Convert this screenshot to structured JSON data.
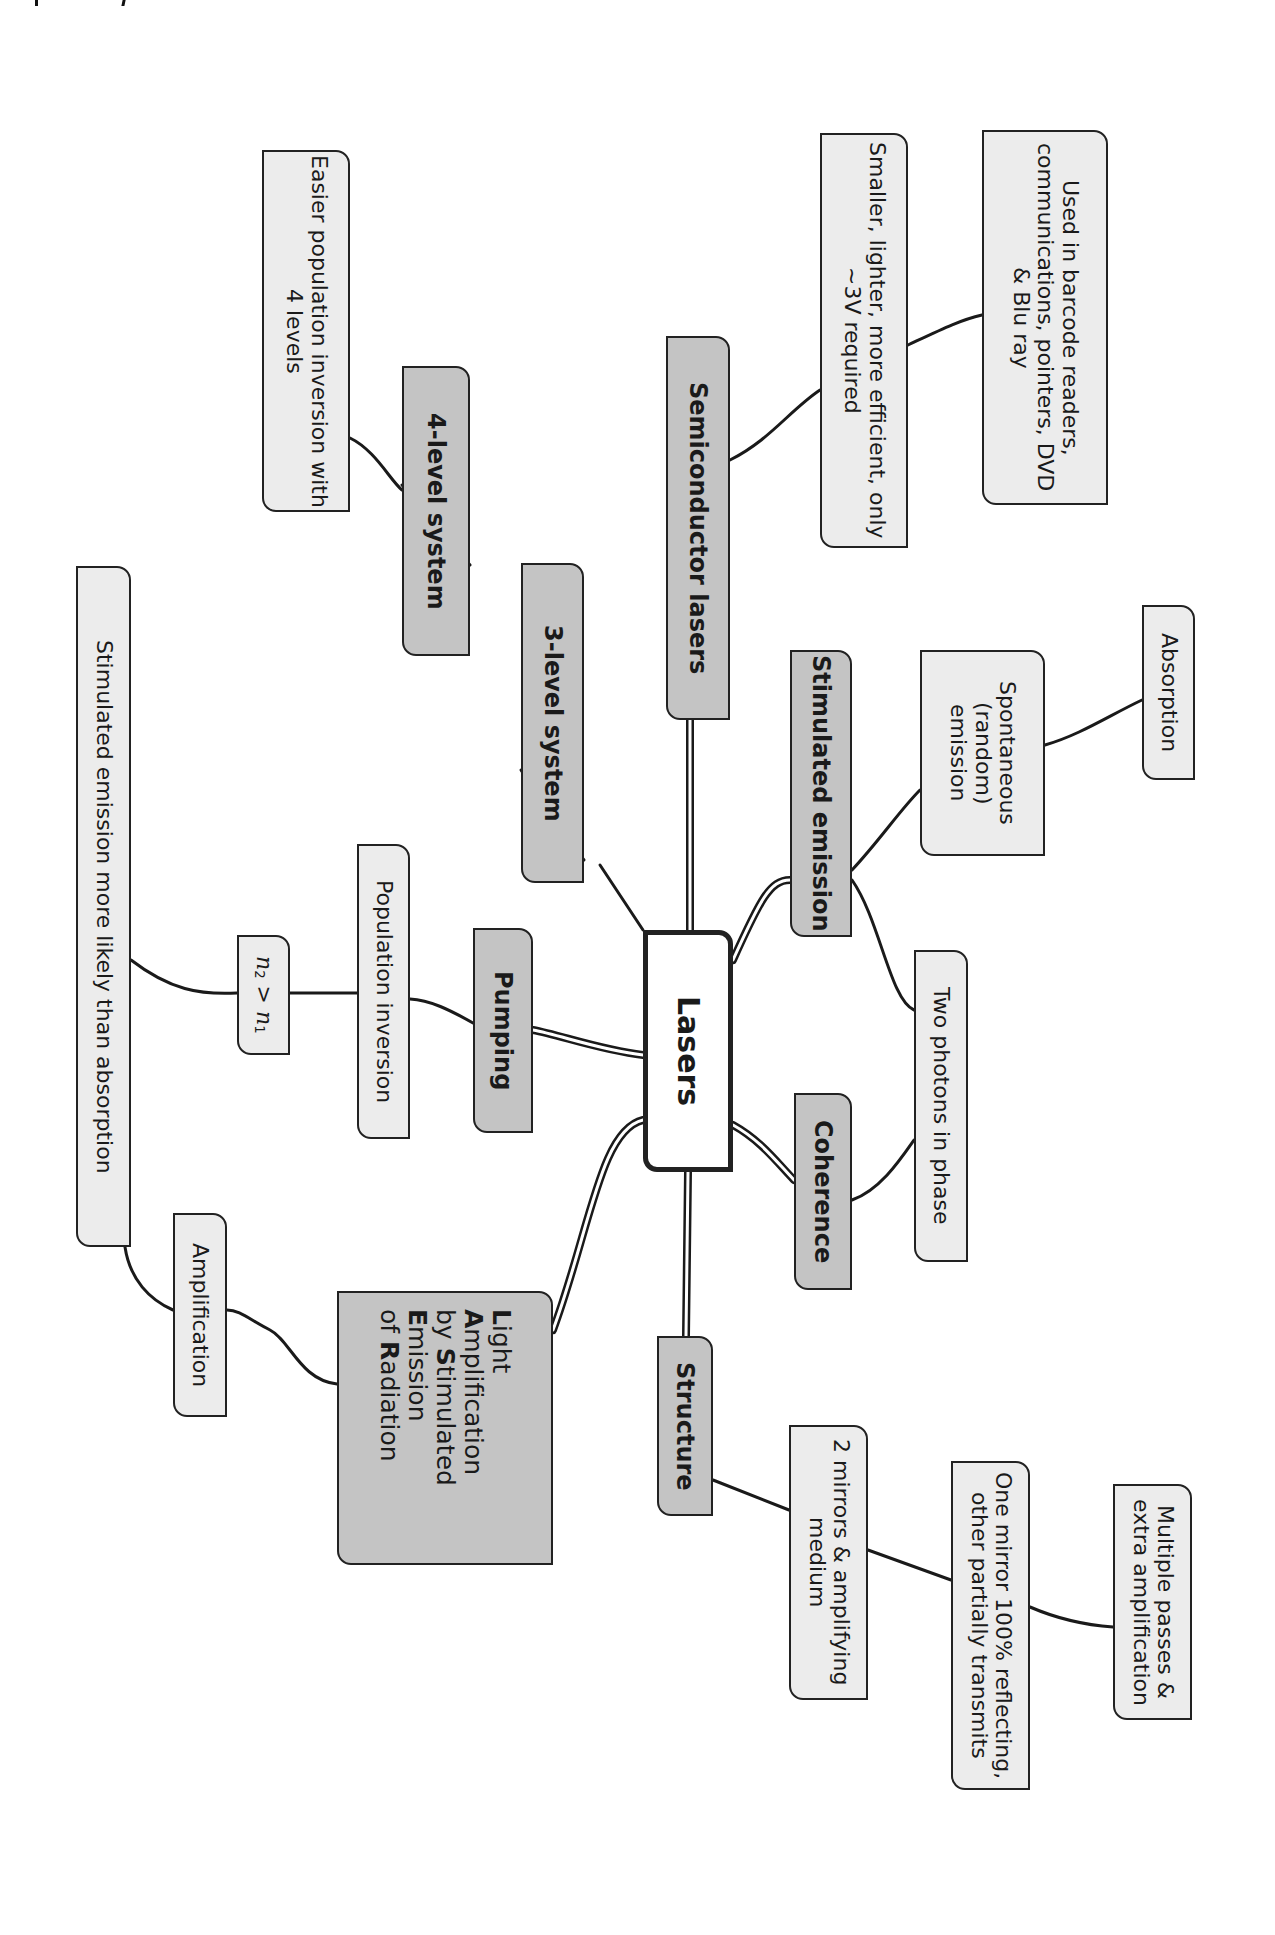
{
  "diagram": {
    "type": "mind-map",
    "orientation": "rotated-90-clockwise",
    "colors": {
      "center_fill": "#ffffff",
      "main_fill": "#c4c4c4",
      "sub_fill": "#ececec",
      "border": "#222222",
      "connector": "#1a1a1a"
    },
    "center": {
      "label": "Lasers"
    },
    "branches": {
      "semiconductor": {
        "label": "Semiconductor lasers",
        "children": {
          "smaller": "Smaller, lighter, more efficient, only ~3V required",
          "uses": "Used in barcode readers, communications, pointers, DVD & Blu ray"
        }
      },
      "stimulated_emission": {
        "label": "Stimulated emission",
        "children": {
          "spontaneous": "Spontaneous (random) emission",
          "absorption": "Absorption",
          "two_photons": "Two photons in phase"
        }
      },
      "coherence": {
        "label": "Coherence"
      },
      "structure": {
        "label": "Structure",
        "children": {
          "mirrors": "2 mirrors & amplifying medium",
          "one_mirror": "One mirror 100% reflecting, other partially transmits",
          "multiple_passes": "Multiple passes & extra amplification"
        }
      },
      "three_level": {
        "label": "3-level system",
        "children": {
          "four_level": "4-level system",
          "easier": "Easier population inversion with 4 levels"
        }
      },
      "pumping": {
        "label": "Pumping",
        "children": {
          "population_inversion": "Population inversion",
          "n2_gt_n1": {
            "n": "n",
            "sub2": "2",
            "op": " > ",
            "sub1": "1"
          },
          "more_likely": "Stimulated emission more likely than absorption"
        }
      },
      "acronym": {
        "lines": [
          {
            "bold": "L",
            "rest": "ight"
          },
          {
            "bold": "A",
            "rest": "mplification"
          },
          {
            "pre": "by ",
            "bold": "S",
            "rest": "timulated"
          },
          {
            "bold": "E",
            "rest": "mission"
          },
          {
            "pre": "of ",
            "bold": "R",
            "rest": "adiation"
          }
        ],
        "children": {
          "amplification": "Amplification"
        }
      }
    }
  }
}
